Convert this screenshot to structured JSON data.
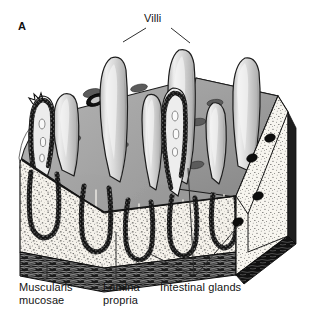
{
  "figure": {
    "panel_letter": "A",
    "background_color": "#ffffff",
    "ink_color": "#141414"
  },
  "labels": {
    "villi": "Villi",
    "muscularis_mucosae": "Muscularis\nmucosae",
    "lamina_propria": "Lamina\npropria",
    "intestinal_glands": "Intestinal glands"
  },
  "palette": {
    "villus_fill": "#d6d6d6",
    "villus_highlight": "#f2f2f2",
    "top_surface": "#9b9b9b",
    "top_surface_dark": "#8a8a8a",
    "gland_opening": "#4a4a4a",
    "cut_face": "#f4f1ea",
    "stipple": "#2a2a2a",
    "crypt_wall": "#1a1a1a",
    "muscularis": "#1c1c1c",
    "side_edge": "#232323",
    "outline": "#111111",
    "leader_line": "#3a3a3a"
  },
  "structures": {
    "villi_count": 6,
    "crypt_count": 5,
    "gland_openings_top": 11,
    "gland_dots_right_face": 4
  }
}
